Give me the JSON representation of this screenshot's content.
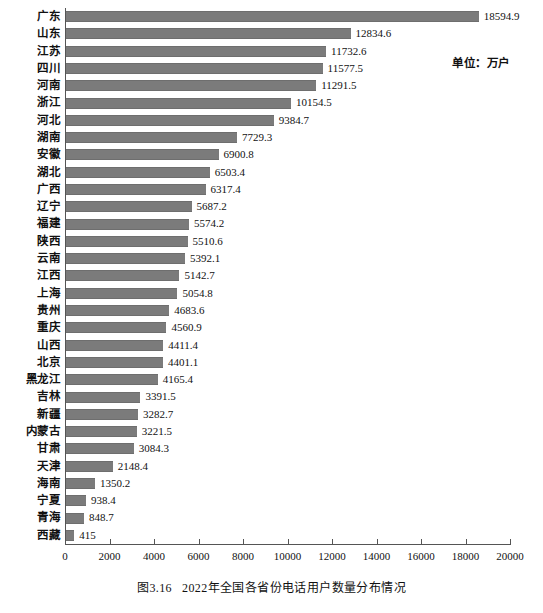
{
  "caption": {
    "number": "图3.16",
    "text": "2022年全国各省份电话用户数量分布情况"
  },
  "annotation": {
    "unit": "单位：万户"
  },
  "chart_data": {
    "type": "bar",
    "orientation": "horizontal",
    "title": "2022年全国各省份电话用户数量分布情况",
    "xlabel": "",
    "ylabel": "",
    "unit": "万户",
    "xlim": [
      0,
      20000
    ],
    "xticks": [
      0,
      2000,
      4000,
      6000,
      8000,
      10000,
      12000,
      14000,
      16000,
      18000,
      20000
    ],
    "xtick_labels": [
      "0",
      "2000",
      "4000",
      "6000",
      "8000",
      "10000",
      "12000",
      "14000",
      "16000",
      "18000",
      "20000"
    ],
    "grid": false,
    "legend": false,
    "bar_color": "#7b7b7b",
    "categories": [
      "广东",
      "山东",
      "江苏",
      "四川",
      "河南",
      "浙江",
      "河北",
      "湖南",
      "安徽",
      "湖北",
      "广西",
      "辽宁",
      "福建",
      "陕西",
      "云南",
      "江西",
      "上海",
      "贵州",
      "重庆",
      "山西",
      "北京",
      "黑龙江",
      "吉林",
      "新疆",
      "内蒙古",
      "甘肃",
      "天津",
      "海南",
      "宁夏",
      "青海",
      "西藏"
    ],
    "values": [
      18594.9,
      12834.6,
      11732.6,
      11577.5,
      11291.5,
      10154.5,
      9384.7,
      7729.3,
      6900.8,
      6503.4,
      6317.4,
      5687.2,
      5574.2,
      5510.6,
      5392.1,
      5142.7,
      5054.8,
      4683.6,
      4560.9,
      4411.4,
      4401.1,
      4165.4,
      3391.5,
      3282.7,
      3221.5,
      3084.3,
      2148.4,
      1350.2,
      938.4,
      848.7,
      415
    ],
    "value_labels": [
      "18594.9",
      "12834.6",
      "11732.6",
      "11577.5",
      "11291.5",
      "10154.5",
      "9384.7",
      "7729.3",
      "6900.8",
      "6503.4",
      "6317.4",
      "5687.2",
      "5574.2",
      "5510.6",
      "5392.1",
      "5142.7",
      "5054.8",
      "4683.6",
      "4560.9",
      "4411.4",
      "4401.1",
      "4165.4",
      "3391.5",
      "3282.7",
      "3221.5",
      "3084.3",
      "2148.4",
      "1350.2",
      "938.4",
      "848.7",
      "415"
    ]
  }
}
